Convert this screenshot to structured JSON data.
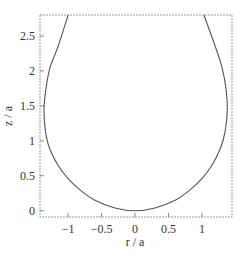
{
  "chart_data": {
    "type": "line",
    "title": "",
    "xlabel": "r / a",
    "ylabel": "z / a",
    "xlim": [
      -1.42,
      1.45
    ],
    "ylim": [
      -0.09,
      2.8
    ],
    "grid": false,
    "legend": null,
    "x_ticks": [
      {
        "value": -1,
        "label": "−1"
      },
      {
        "value": -0.5,
        "label": "−0.5"
      },
      {
        "value": 0,
        "label": "0"
      },
      {
        "value": 0.5,
        "label": "0.5"
      },
      {
        "value": 1,
        "label": "1"
      }
    ],
    "y_ticks": [
      {
        "value": 0,
        "label": "0"
      },
      {
        "value": 0.5,
        "label": "0.5"
      },
      {
        "value": 1,
        "label": "1"
      },
      {
        "value": 1.5,
        "label": "1.5"
      },
      {
        "value": 2,
        "label": "2"
      },
      {
        "value": 2.5,
        "label": "2.5"
      }
    ],
    "series": [
      {
        "name": "profile",
        "color": "#555555",
        "points": [
          [
            -1.0,
            2.8
          ],
          [
            -1.15,
            2.35
          ],
          [
            -1.27,
            2.05
          ],
          [
            -1.33,
            1.75
          ],
          [
            -1.36,
            1.45
          ],
          [
            -1.34,
            1.15
          ],
          [
            -1.28,
            0.9
          ],
          [
            -1.15,
            0.65
          ],
          [
            -1.0,
            0.46
          ],
          [
            -0.8,
            0.28
          ],
          [
            -0.6,
            0.15
          ],
          [
            -0.3,
            0.04
          ],
          [
            0.0,
            0.0
          ],
          [
            0.3,
            0.04
          ],
          [
            0.6,
            0.15
          ],
          [
            0.8,
            0.28
          ],
          [
            1.0,
            0.46
          ],
          [
            1.15,
            0.65
          ],
          [
            1.28,
            0.9
          ],
          [
            1.35,
            1.15
          ],
          [
            1.38,
            1.45
          ],
          [
            1.36,
            1.75
          ],
          [
            1.3,
            2.05
          ],
          [
            1.2,
            2.35
          ],
          [
            1.03,
            2.8
          ]
        ]
      }
    ]
  },
  "axes": {
    "xlabel": "r / a",
    "ylabel": "z / a"
  }
}
